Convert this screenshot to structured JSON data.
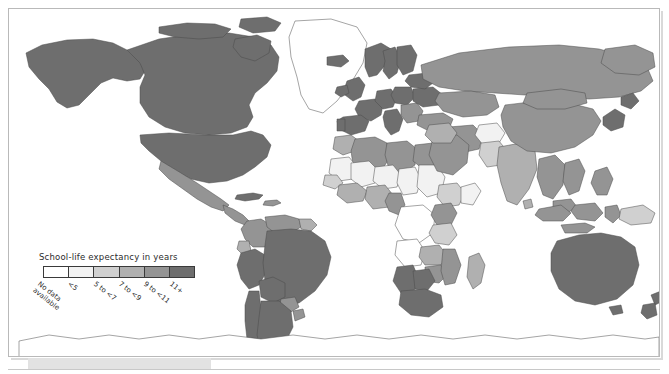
{
  "map": {
    "title": "World map of school-life expectancy",
    "projection": "world-equirectangular",
    "ocean_color": "#ffffff",
    "border_color": "#4a4a4a",
    "frame_color": "#b9b9b9"
  },
  "legend": {
    "title": "School-life expectancy in years",
    "classes": [
      {
        "label": "No data available",
        "color": "#ffffff",
        "two_line": true
      },
      {
        "label": "<5",
        "color": "#f2f2f2",
        "two_line": false
      },
      {
        "label": "5 to <7",
        "color": "#d0d0d0",
        "two_line": false
      },
      {
        "label": "7 to <9",
        "color": "#b0b0b0",
        "two_line": false
      },
      {
        "label": "9 to <11",
        "color": "#949494",
        "two_line": false
      },
      {
        "label": "11+",
        "color": "#6e6e6e",
        "two_line": false
      }
    ]
  },
  "chart_data": {
    "type": "heatmap",
    "title": "School-life expectancy in years",
    "xlabel": "",
    "ylabel": "",
    "legend_position": "bottom-left",
    "grid": false,
    "categories": [
      "No data available",
      "<5",
      "5 to <7",
      "7 to <9",
      "9 to <11",
      "11+"
    ],
    "colors": [
      "#ffffff",
      "#f2f2f2",
      "#d0d0d0",
      "#b0b0b0",
      "#949494",
      "#6e6e6e"
    ],
    "regions": [
      {
        "name": "Canada",
        "class": "11+"
      },
      {
        "name": "United States",
        "class": "11+"
      },
      {
        "name": "Greenland",
        "class": "No data available"
      },
      {
        "name": "Mexico",
        "class": "9 to <11"
      },
      {
        "name": "Guatemala",
        "class": "9 to <11"
      },
      {
        "name": "Cuba",
        "class": "11+"
      },
      {
        "name": "Colombia",
        "class": "9 to <11"
      },
      {
        "name": "Venezuela",
        "class": "9 to <11"
      },
      {
        "name": "Peru",
        "class": "11+"
      },
      {
        "name": "Bolivia",
        "class": "11+"
      },
      {
        "name": "Brazil",
        "class": "11+"
      },
      {
        "name": "Paraguay",
        "class": "9 to <11"
      },
      {
        "name": "Argentina",
        "class": "11+"
      },
      {
        "name": "Chile",
        "class": "11+"
      },
      {
        "name": "United Kingdom",
        "class": "11+"
      },
      {
        "name": "Ireland",
        "class": "11+"
      },
      {
        "name": "France",
        "class": "11+"
      },
      {
        "name": "Spain",
        "class": "11+"
      },
      {
        "name": "Portugal",
        "class": "11+"
      },
      {
        "name": "Germany",
        "class": "11+"
      },
      {
        "name": "Poland",
        "class": "11+"
      },
      {
        "name": "Italy",
        "class": "11+"
      },
      {
        "name": "Norway",
        "class": "11+"
      },
      {
        "name": "Sweden",
        "class": "11+"
      },
      {
        "name": "Finland",
        "class": "11+"
      },
      {
        "name": "Ukraine",
        "class": "11+"
      },
      {
        "name": "Turkey",
        "class": "9 to <11"
      },
      {
        "name": "Russia",
        "class": "9 to <11"
      },
      {
        "name": "Kazakhstan",
        "class": "9 to <11"
      },
      {
        "name": "China",
        "class": "9 to <11"
      },
      {
        "name": "Mongolia",
        "class": "9 to <11"
      },
      {
        "name": "Japan",
        "class": "11+"
      },
      {
        "name": "India",
        "class": "7 to <9"
      },
      {
        "name": "Pakistan",
        "class": "5 to <7"
      },
      {
        "name": "Afghanistan",
        "class": "<5"
      },
      {
        "name": "Iran",
        "class": "9 to <11"
      },
      {
        "name": "Saudi Arabia",
        "class": "9 to <11"
      },
      {
        "name": "Egypt",
        "class": "9 to <11"
      },
      {
        "name": "Libya",
        "class": "9 to <11"
      },
      {
        "name": "Algeria",
        "class": "9 to <11"
      },
      {
        "name": "Morocco",
        "class": "7 to <9"
      },
      {
        "name": "Sudan",
        "class": "<5"
      },
      {
        "name": "Ethiopia",
        "class": "5 to <7"
      },
      {
        "name": "Niger",
        "class": "<5"
      },
      {
        "name": "Mali",
        "class": "<5"
      },
      {
        "name": "Nigeria",
        "class": "7 to <9"
      },
      {
        "name": "Democratic Republic of the Congo",
        "class": "No data available"
      },
      {
        "name": "Angola",
        "class": "No data available"
      },
      {
        "name": "Kenya",
        "class": "9 to <11"
      },
      {
        "name": "Tanzania",
        "class": "5 to <7"
      },
      {
        "name": "Zambia",
        "class": "7 to <9"
      },
      {
        "name": "Zimbabwe",
        "class": "9 to <11"
      },
      {
        "name": "South Africa",
        "class": "11+"
      },
      {
        "name": "Namibia",
        "class": "11+"
      },
      {
        "name": "Botswana",
        "class": "11+"
      },
      {
        "name": "Madagascar",
        "class": "7 to <9"
      },
      {
        "name": "Indonesia",
        "class": "9 to <11"
      },
      {
        "name": "Papua New Guinea",
        "class": "5 to <7"
      },
      {
        "name": "Australia",
        "class": "11+"
      },
      {
        "name": "New Zealand",
        "class": "11+"
      },
      {
        "name": "Antarctica",
        "class": "No data available"
      }
    ]
  }
}
